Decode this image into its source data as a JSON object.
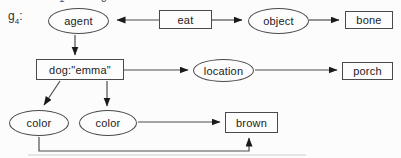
{
  "figure_label": {
    "base": "g",
    "subscript": "4",
    "suffix": ":"
  },
  "top_edge_fragments": [
    "1",
    "3"
  ],
  "colors": {
    "stroke": "#4d4d4d",
    "arrowhead": "#1a1a1a",
    "text": "#222222",
    "background": "#fcfcfc",
    "node_fill": "#fdfdfd"
  },
  "nodes": {
    "agent": {
      "label": "agent",
      "shape": "ellipse"
    },
    "eat": {
      "label": "eat",
      "shape": "rect"
    },
    "object": {
      "label": "object",
      "shape": "ellipse"
    },
    "bone": {
      "label": "bone",
      "shape": "rect"
    },
    "dog_emma": {
      "label": "dog:\"emma\"",
      "shape": "rect"
    },
    "location": {
      "label": "location",
      "shape": "ellipse"
    },
    "porch": {
      "label": "porch",
      "shape": "rect"
    },
    "color_left": {
      "label": "color",
      "shape": "ellipse"
    },
    "color_right": {
      "label": "color",
      "shape": "ellipse"
    },
    "brown": {
      "label": "brown",
      "shape": "rect"
    }
  },
  "edges": [
    {
      "from": "eat",
      "to": "agent"
    },
    {
      "from": "eat",
      "to": "object"
    },
    {
      "from": "object",
      "to": "bone"
    },
    {
      "from": "agent",
      "to": "dog_emma"
    },
    {
      "from": "dog_emma",
      "to": "location"
    },
    {
      "from": "location",
      "to": "porch"
    },
    {
      "from": "dog_emma",
      "to": "color_left"
    },
    {
      "from": "dog_emma",
      "to": "color_right"
    },
    {
      "from": "color_right",
      "to": "brown"
    },
    {
      "from": "color_left",
      "to": "brown"
    }
  ]
}
